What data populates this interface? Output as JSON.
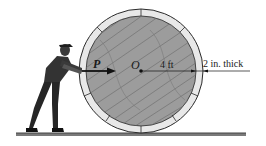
{
  "diagram": {
    "labels": {
      "force": "P",
      "center": "O",
      "radius": "4 ft",
      "rim_thickness": "2 in. thick"
    },
    "colors": {
      "wood": "#9a9a9a",
      "wood_grain": "#6e6e6e",
      "rim": "#e6e6e6",
      "outline": "#2a2a2a",
      "ground": "#555555",
      "figure": "#2b2b2b"
    },
    "geometry": {
      "wheel_center": [
        141,
        71
      ],
      "outer_radius_px": 62,
      "inner_radius_px": 55,
      "ground_y": 134
    }
  }
}
